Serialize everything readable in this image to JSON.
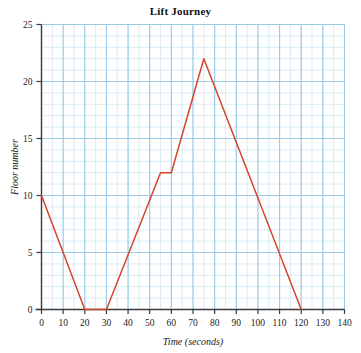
{
  "chart_data": {
    "type": "line",
    "title": "Lift Journey",
    "xlabel": "Time (seconds)",
    "ylabel": "Floor number",
    "xlim": [
      0,
      140
    ],
    "ylim": [
      0,
      25
    ],
    "xticks": [
      0,
      10,
      20,
      30,
      40,
      50,
      60,
      70,
      80,
      90,
      100,
      110,
      120,
      130,
      140
    ],
    "yticks": [
      0,
      5,
      10,
      15,
      20,
      25
    ],
    "grid": true,
    "grid_minor_step_x": 5,
    "grid_minor_step_y": 1,
    "legend": null,
    "series": [
      {
        "name": "Lift journey",
        "color": "#d4452a",
        "x": [
          0,
          20,
          30,
          55,
          60,
          75,
          120
        ],
        "y": [
          10,
          0,
          0,
          12,
          12,
          22,
          0
        ]
      }
    ],
    "colors": {
      "line": "#d4452a",
      "grid_minor": "#cfe6f5",
      "grid_major": "#9ccbe8",
      "axis": "#3a3a3a",
      "text": "#1a1a1a",
      "background": "#ffffff"
    }
  }
}
